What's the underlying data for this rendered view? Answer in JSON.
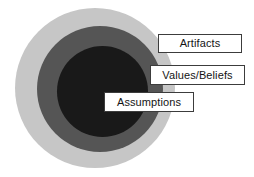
{
  "diagram": {
    "type": "concentric-circles",
    "background_color": "#ffffff",
    "rings": [
      {
        "id": "outer",
        "name": "outer-ring",
        "color": "#c6c6c6",
        "label": "Artifacts"
      },
      {
        "id": "middle",
        "name": "middle-ring",
        "color": "#555555",
        "label": "Values/Beliefs"
      },
      {
        "id": "inner",
        "name": "inner-ring",
        "color": "#191919",
        "label": "Assumptions"
      }
    ],
    "labels": [
      {
        "text": "Artifacts",
        "border_color": "#3c3c3c",
        "fill_color": "#ffffff",
        "text_color": "#141414"
      },
      {
        "text": "Values/Beliefs",
        "border_color": "#3c3c3c",
        "fill_color": "#ffffff",
        "text_color": "#141414"
      },
      {
        "text": "Assumptions",
        "border_color": "#3c3c3c",
        "fill_color": "#ffffff",
        "text_color": "#141414"
      }
    ]
  }
}
